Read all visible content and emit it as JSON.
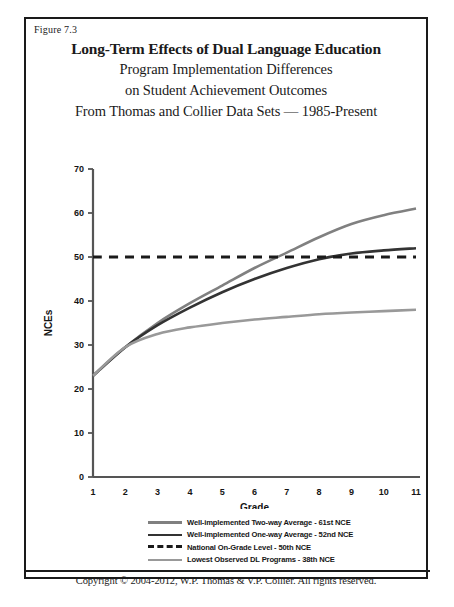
{
  "figure": {
    "number_label": "Figure 7.3",
    "title_main": "Long-Term Effects of Dual Language Education",
    "title_line2": "Program Implementation Differences",
    "title_line3": "on Student Achievement Outcomes",
    "title_line4": "From Thomas and Collier Data Sets — 1985-Present",
    "copyright": "Copyright © 2004-2012, W.P. Thomas & V.P. Collier.  All rights reserved."
  },
  "colors": {
    "two_way": "#808080",
    "one_way": "#333333",
    "national": "#1a1a1a",
    "lowest": "#999999",
    "axis": "#555555",
    "frame": "#1a1a1a"
  },
  "legend": {
    "items": [
      {
        "label": "Well-implemented Two-way Average - 61st NCE",
        "color": "#808080",
        "style": "solid",
        "swatch_name": "legend-swatch-two-way"
      },
      {
        "label": "Well-implemented One-way Average - 52nd NCE",
        "color": "#333333",
        "style": "solid",
        "swatch_name": "legend-swatch-one-way"
      },
      {
        "label": "National On-Grade Level - 50th NCE",
        "color": "#1a1a1a",
        "style": "dashed",
        "swatch_name": "legend-swatch-national"
      },
      {
        "label": "Lowest Observed DL Programs - 38th NCE",
        "color": "#999999",
        "style": "solid",
        "swatch_name": "legend-swatch-lowest"
      }
    ]
  },
  "chart_data": {
    "type": "line",
    "title": "Long-Term Effects of Dual Language Education",
    "subtitle": "Program Implementation Differences on Student Achievement Outcomes — From Thomas and Collier Data Sets — 1985-Present",
    "xlabel": "Grade",
    "ylabel": "NCEs",
    "x": [
      1,
      2,
      3,
      4,
      5,
      6,
      7,
      8,
      9,
      10,
      11
    ],
    "xtick_labels": [
      "1",
      "2",
      "3",
      "4",
      "5",
      "6",
      "7",
      "8",
      "9",
      "10",
      "11"
    ],
    "ytick_labels": [
      "0",
      "10",
      "20",
      "30",
      "40",
      "50",
      "60",
      "70"
    ],
    "xlim": [
      1,
      11
    ],
    "ylim": [
      0,
      70
    ],
    "ytick_step": 10,
    "grid": false,
    "legend_position": "below-plot",
    "series": [
      {
        "name": "Well-implemented Two-way Average - 61st NCE",
        "color": "#808080",
        "style": "solid",
        "final_value": 61,
        "values": [
          23,
          29.5,
          35,
          39.5,
          43.5,
          47.5,
          51,
          54.5,
          57.5,
          59.5,
          61
        ]
      },
      {
        "name": "Well-implemented One-way Average - 52nd NCE",
        "color": "#333333",
        "style": "solid",
        "final_value": 52,
        "values": [
          23,
          29.5,
          34.5,
          38.5,
          42,
          45,
          47.5,
          49.5,
          50.8,
          51.5,
          52
        ]
      },
      {
        "name": "National On-Grade Level - 50th NCE",
        "color": "#1a1a1a",
        "style": "dashed",
        "final_value": 50,
        "values": [
          50,
          50,
          50,
          50,
          50,
          50,
          50,
          50,
          50,
          50,
          50
        ]
      },
      {
        "name": "Lowest Observed DL Programs - 38th NCE",
        "color": "#999999",
        "style": "solid",
        "final_value": 38,
        "values": [
          23,
          29.5,
          32.5,
          34,
          35,
          35.8,
          36.4,
          37,
          37.4,
          37.7,
          38
        ]
      }
    ]
  }
}
